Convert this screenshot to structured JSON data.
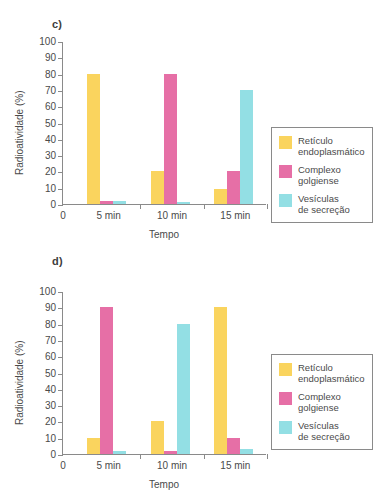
{
  "figure": {
    "panels": [
      {
        "letter": "c)",
        "xlabel": "Tempo",
        "ylabel": "Radioatividade (%)"
      },
      {
        "letter": "d)",
        "xlabel": "Tempo",
        "ylabel": "Radioatividade (%)"
      }
    ],
    "yticks": [
      "100",
      "90",
      "80",
      "70",
      "60",
      "50",
      "40",
      "30",
      "20",
      "10",
      "0"
    ],
    "origin_label": "0",
    "legend": [
      {
        "label": "Retículo\nendoplasmático",
        "color": "#fad45e"
      },
      {
        "label": "Complexo\ngolgiense",
        "color": "#e66fa6"
      },
      {
        "label": "Vesículas\nde secreção",
        "color": "#93dfe4"
      }
    ]
  },
  "chart_data": [
    {
      "type": "bar",
      "title": "c)",
      "xlabel": "Tempo",
      "ylabel": "Radioatividade (%)",
      "ylim": [
        0,
        100
      ],
      "ytick_step": 10,
      "grid": false,
      "legend_position": "right",
      "categories": [
        "5 min",
        "10 min",
        "15 min"
      ],
      "series": [
        {
          "name": "Retículo endoplasmático",
          "color": "#fad45e",
          "values": [
            80,
            20,
            9
          ]
        },
        {
          "name": "Complexo golgiense",
          "color": "#e66fa6",
          "values": [
            2,
            80,
            20
          ]
        },
        {
          "name": "Vesículas de secreção",
          "color": "#93dfe4",
          "values": [
            2,
            1,
            70
          ]
        }
      ]
    },
    {
      "type": "bar",
      "title": "d)",
      "xlabel": "Tempo",
      "ylabel": "Radioatividade (%)",
      "ylim": [
        0,
        100
      ],
      "ytick_step": 10,
      "grid": false,
      "legend_position": "right",
      "categories": [
        "5 min",
        "10 min",
        "15 min"
      ],
      "series": [
        {
          "name": "Retículo endoplasmático",
          "color": "#fad45e",
          "values": [
            10,
            20,
            90
          ]
        },
        {
          "name": "Complexo golgiense",
          "color": "#e66fa6",
          "values": [
            90,
            2,
            10
          ]
        },
        {
          "name": "Vesículas de secreção",
          "color": "#93dfe4",
          "values": [
            2,
            80,
            3
          ]
        }
      ]
    }
  ]
}
